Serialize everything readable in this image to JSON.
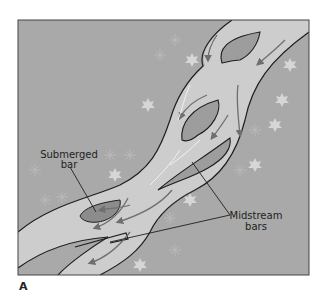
{
  "figure": {
    "panel_label": "A",
    "labels": {
      "submerged_line1": "Submerged",
      "submerged_line2": "bar",
      "midstream_line1": "Midstream",
      "midstream_line2": "bars"
    },
    "colors": {
      "background": "#a9a9a9",
      "river": "#cdcdcd",
      "bar": "#9d9d9d",
      "submerged_bar": "#8c8c8c",
      "bank_line": "#1e1e1e",
      "flow_arrow": "#6f6f6f",
      "foliage": "#d6d6d6"
    }
  }
}
